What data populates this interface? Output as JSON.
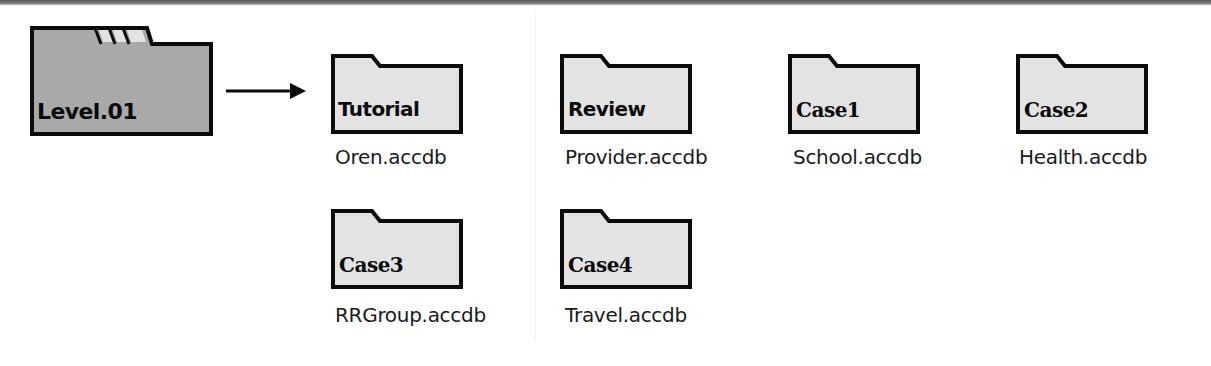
{
  "colors": {
    "level_folder_fill": "#a9a9a9",
    "level_folder_stripes": "#e2e2e2",
    "sub_folder_fill": "#e3e3e3",
    "outline": "#0b0b0b"
  },
  "root": {
    "label": "Level.01",
    "icon": "folder-icon"
  },
  "connector": {
    "icon": "arrow-right-icon"
  },
  "subfolders": [
    {
      "label": "Tutorial",
      "file": "Oren.accdb"
    },
    {
      "label": "Review",
      "file": "Provider.accdb"
    },
    {
      "label": "Case1",
      "file": "School.accdb"
    },
    {
      "label": "Case2",
      "file": "Health.accdb"
    },
    {
      "label": "Case3",
      "file": "RRGroup.accdb"
    },
    {
      "label": "Case4",
      "file": "Travel.accdb"
    }
  ]
}
